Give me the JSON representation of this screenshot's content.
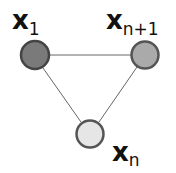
{
  "diagram": {
    "type": "graph",
    "nodes": [
      {
        "id": "x1",
        "label_main": "x",
        "label_sub": "1",
        "cx": 35,
        "cy": 55,
        "r": 15,
        "fill": "#7a7a7a",
        "stroke": "#444444"
      },
      {
        "id": "xn1",
        "label_main": "x",
        "label_sub": "n+1",
        "cx": 145,
        "cy": 55,
        "r": 14,
        "fill": "#aaaaaa",
        "stroke": "#555555"
      },
      {
        "id": "xn",
        "label_main": "x",
        "label_sub": "n",
        "cx": 90,
        "cy": 134,
        "r": 14,
        "fill": "#e6e6e6",
        "stroke": "#555555"
      }
    ],
    "edges": [
      {
        "from": "x1",
        "to": "xn1"
      },
      {
        "from": "x1",
        "to": "xn"
      },
      {
        "from": "xn1",
        "to": "xn"
      }
    ],
    "edge_color": "#666666"
  }
}
